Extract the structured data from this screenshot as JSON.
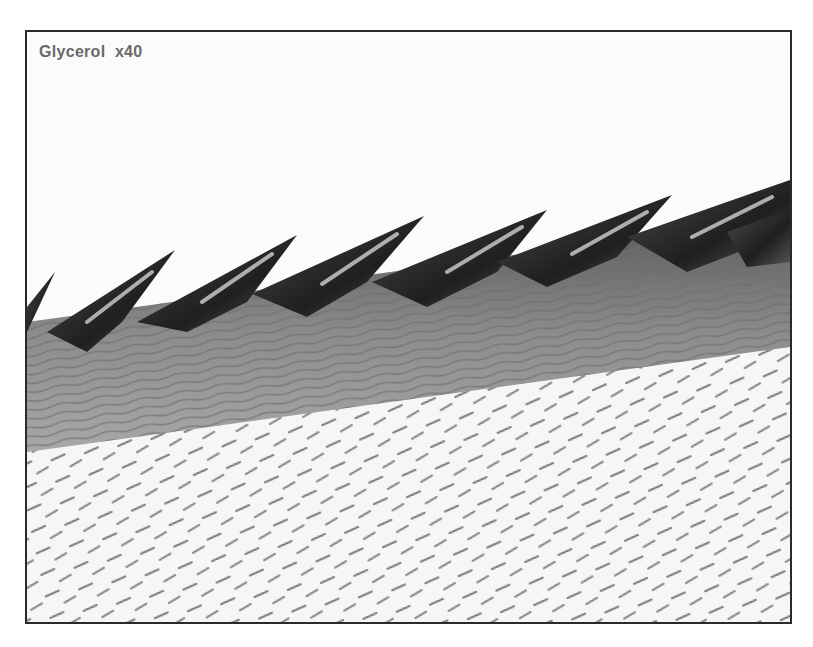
{
  "figure": {
    "label": "Glycerol  x40",
    "colors": {
      "background": "#fbfbfb",
      "border": "#2a2a2a",
      "spine_dark": "#262626",
      "band": "#8a8a8a",
      "label": "#6a6a6a"
    }
  }
}
